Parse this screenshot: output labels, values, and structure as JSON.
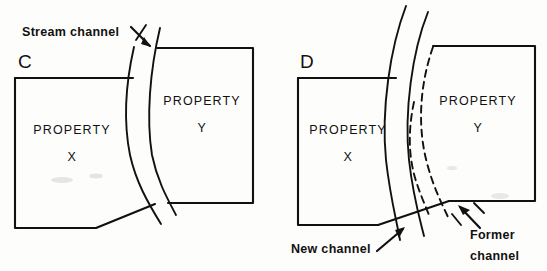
{
  "figure": {
    "background_color": "#fdfdfc",
    "ink_color": "#111111"
  },
  "panels": [
    {
      "id": "C",
      "letter": "C",
      "letter_pos": {
        "x": 18,
        "y": 68
      },
      "description": "Gradual accretion - boundary follows stream channel",
      "properties": [
        {
          "name": "PROPERTY",
          "designator": "X",
          "name_pos": {
            "x": 72,
            "y": 134
          },
          "designator_pos": {
            "x": 72,
            "y": 161
          }
        },
        {
          "name": "PROPERTY",
          "designator": "Y",
          "name_pos": {
            "x": 202,
            "y": 105
          },
          "designator_pos": {
            "x": 202,
            "y": 132
          }
        }
      ],
      "callouts": [
        {
          "id": "stream-channel",
          "text": "Stream channel",
          "text_pos": {
            "x": 22,
            "y": 36
          },
          "arrow_from": {
            "x": 132,
            "y": 28
          },
          "arrow_to": {
            "x": 150,
            "y": 47
          }
        }
      ]
    },
    {
      "id": "D",
      "letter": "D",
      "letter_pos": {
        "x": 300,
        "y": 68
      },
      "description": "Avulsion - boundary remains at former channel",
      "properties": [
        {
          "name": "PROPERTY",
          "designator": "X",
          "name_pos": {
            "x": 348,
            "y": 134
          },
          "designator_pos": {
            "x": 348,
            "y": 161
          }
        },
        {
          "name": "PROPERTY",
          "designator": "Y",
          "name_pos": {
            "x": 478,
            "y": 105
          },
          "designator_pos": {
            "x": 478,
            "y": 132
          }
        }
      ],
      "callouts": [
        {
          "id": "new-channel",
          "text": "New channel",
          "text_pos": {
            "x": 291,
            "y": 253
          },
          "arrow_from": {
            "x": 379,
            "y": 250
          },
          "arrow_to": {
            "x": 404,
            "y": 228
          }
        },
        {
          "id": "former-channel",
          "text_line_1": "Former",
          "text_line_2": "channel",
          "line1_pos": {
            "x": 470,
            "y": 239
          },
          "line2_pos": {
            "x": 470,
            "y": 260
          },
          "arrow_from": {
            "x": 479,
            "y": 227
          },
          "arrow_to": {
            "x": 458,
            "y": 206
          }
        }
      ]
    }
  ],
  "legend_semantics": {
    "solid_line": "existing property boundary / stream bank",
    "dashed_line": "former stream channel position"
  }
}
